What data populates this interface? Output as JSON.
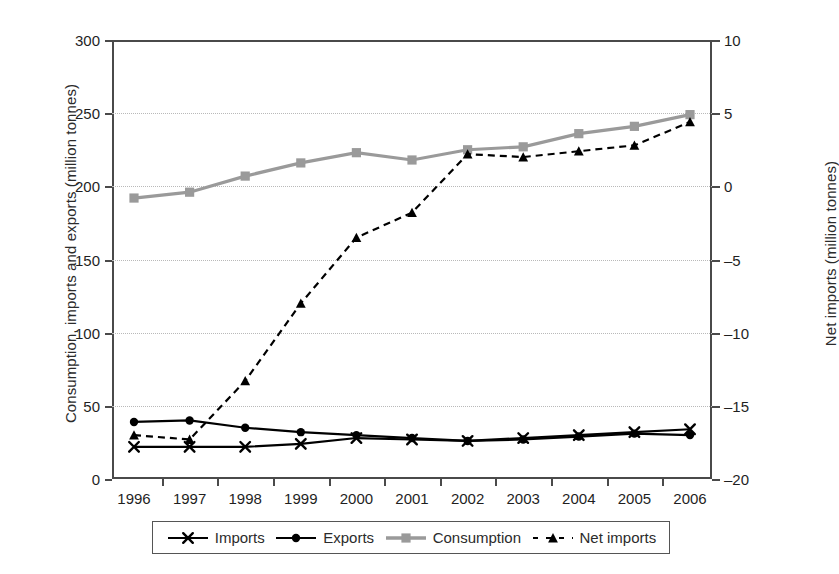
{
  "chart_data": {
    "type": "line",
    "title": "",
    "xlabel": "",
    "ylabel": "Consumption, imports and exports (million tonnes)",
    "y2label": "Net imports (million tonnes)",
    "categories": [
      "1996",
      "1997",
      "1998",
      "1999",
      "2000",
      "2001",
      "2002",
      "2003",
      "2004",
      "2005",
      "2006"
    ],
    "ylim": [
      0,
      300
    ],
    "yticks": [
      0,
      50,
      100,
      150,
      200,
      250,
      300
    ],
    "y2lim": [
      -20,
      10
    ],
    "y2ticks": [
      -20,
      -15,
      -10,
      -5,
      0,
      5,
      10
    ],
    "grid": true,
    "legend_position": "bottom",
    "series": [
      {
        "name": "Imports",
        "axis": "left",
        "marker": "x",
        "line_style": "solid",
        "color": "#000000",
        "values": [
          22,
          22,
          22,
          24,
          28,
          27,
          26,
          28,
          30,
          32,
          34
        ]
      },
      {
        "name": "Exports",
        "axis": "left",
        "marker": "circle",
        "line_style": "solid",
        "color": "#000000",
        "values": [
          39,
          40,
          35,
          32,
          30,
          28,
          26,
          27,
          29,
          31,
          30
        ]
      },
      {
        "name": "Consumption",
        "axis": "left",
        "marker": "square",
        "line_style": "solid",
        "color": "#9a9a9a",
        "values": [
          192,
          196,
          207,
          216,
          223,
          218,
          225,
          227,
          236,
          241,
          249
        ]
      },
      {
        "name": "Net imports",
        "axis": "right",
        "marker": "triangle",
        "line_style": "dashed",
        "color": "#000000",
        "values": [
          -17.0,
          -17.3,
          -13.3,
          -8.0,
          -3.5,
          -1.8,
          2.2,
          2.0,
          2.4,
          2.8,
          4.4
        ]
      }
    ]
  },
  "axes": {
    "left": {
      "title": "Consumption, imports and exports (million tonnes)",
      "tick_labels": [
        "0",
        "50",
        "100",
        "150",
        "200",
        "250",
        "300"
      ]
    },
    "right": {
      "title": "Net imports (million tonnes)",
      "tick_labels": [
        "-20",
        "-15",
        "-10",
        "-5",
        "0",
        "5",
        "10"
      ]
    },
    "x": {
      "tick_labels": [
        "1996",
        "1997",
        "1998",
        "1999",
        "2000",
        "2001",
        "2002",
        "2003",
        "2004",
        "2005",
        "2006"
      ]
    }
  },
  "legend": {
    "items": [
      {
        "label": "Imports",
        "marker": "x-marker",
        "color": "#000000"
      },
      {
        "label": "Exports",
        "marker": "circle-marker",
        "color": "#000000"
      },
      {
        "label": "Consumption",
        "marker": "square-marker",
        "color": "#9a9a9a"
      },
      {
        "label": "Net imports",
        "marker": "triangle-marker",
        "color": "#000000"
      }
    ]
  },
  "colors": {
    "consumption": "#9a9a9a",
    "dark": "#000000",
    "axis": "#4a4a4a",
    "grid": "#b9b9b9"
  }
}
